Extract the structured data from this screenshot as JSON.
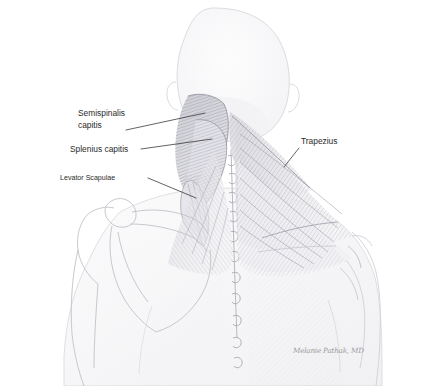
{
  "illustration": {
    "title": "Posterior neck and upper back musculature",
    "medium": "graphite pencil drawing",
    "view": "posterior",
    "background_color": "#ffffff",
    "ink_color": "#2b2b2b",
    "pencil_color": "#8e8e96"
  },
  "labels": [
    {
      "id": "semispinalis-capitis",
      "line1": "Semispinalis",
      "line2": "capitis",
      "size": "large",
      "text_x": 78,
      "text_y": 116,
      "text_y2": 128,
      "leader": "M126,130 L205,113"
    },
    {
      "id": "splenius-capitis",
      "line1": "Splenius capitis",
      "line2": "",
      "size": "large",
      "text_x": 70,
      "text_y": 152,
      "text_y2": 0,
      "leader": "M141,149 L212,139"
    },
    {
      "id": "levator-scapulae",
      "line1": "Levator Scapulae",
      "line2": "",
      "size": "small",
      "text_x": 60,
      "text_y": 180,
      "text_y2": 0,
      "leader": "M148,178 L196,198"
    },
    {
      "id": "trapezius",
      "line1": "Trapezius",
      "line2": "",
      "size": "large",
      "text_x": 301,
      "text_y": 144,
      "text_y2": 0,
      "leader": "M299,148 L284,167"
    }
  ],
  "signature": {
    "text": "Melanie Pathak, MD",
    "x": 293,
    "y": 353
  }
}
